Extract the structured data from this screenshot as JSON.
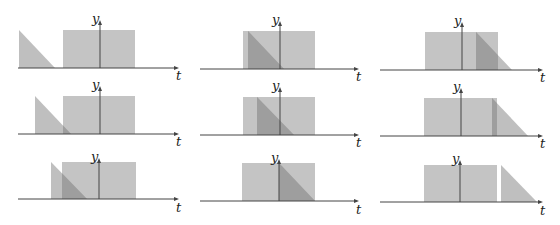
{
  "axis_labels": {
    "y": "y",
    "t": "t"
  },
  "colors": {
    "rect_fill": "#c4c4c4",
    "triangle_fill": "#b4b4b4",
    "overlap_fill": "#9e9e9e",
    "axis": "#444444",
    "background": "#ffffff"
  },
  "panels": [
    {
      "row": 0,
      "col": 0,
      "axis_y": 68,
      "yaxis_x": 100,
      "axis_x0": 18,
      "axis_x1": 179,
      "rect": [
        63,
        135,
        30
      ],
      "tri": [
        19,
        55,
        30
      ],
      "label_y": [
        92,
        17
      ],
      "label_t": [
        176,
        80
      ]
    },
    {
      "row": 0,
      "col": 1,
      "axis_y": 69,
      "yaxis_x": 280,
      "axis_x0": 200,
      "axis_x1": 359,
      "rect": [
        243,
        315,
        31
      ],
      "tri": [
        248,
        284,
        31
      ],
      "label_y": [
        272,
        18
      ],
      "label_t": [
        356,
        81
      ]
    },
    {
      "row": 0,
      "col": 2,
      "axis_y": 70,
      "yaxis_x": 462,
      "axis_x0": 380,
      "axis_x1": 543,
      "rect": [
        425,
        498,
        32
      ],
      "tri": [
        476,
        512,
        32
      ],
      "label_y": [
        454,
        19
      ],
      "label_t": [
        540,
        82
      ]
    },
    {
      "row": 1,
      "col": 0,
      "axis_y": 134,
      "yaxis_x": 100,
      "axis_x0": 18,
      "axis_x1": 179,
      "rect": [
        63,
        135,
        96
      ],
      "tri": [
        35,
        71,
        96
      ],
      "label_y": [
        92,
        83
      ],
      "label_t": [
        176,
        146
      ]
    },
    {
      "row": 1,
      "col": 1,
      "axis_y": 135,
      "yaxis_x": 280,
      "axis_x0": 200,
      "axis_x1": 359,
      "rect": [
        243,
        315,
        97
      ],
      "tri": [
        257,
        294,
        97
      ],
      "label_y": [
        272,
        84
      ],
      "label_t": [
        356,
        147
      ]
    },
    {
      "row": 1,
      "col": 2,
      "axis_y": 136,
      "yaxis_x": 461,
      "axis_x0": 380,
      "axis_x1": 543,
      "rect": [
        424,
        497,
        98
      ],
      "tri": [
        492,
        528,
        98
      ],
      "label_y": [
        453,
        85
      ],
      "label_t": [
        540,
        148
      ]
    },
    {
      "row": 2,
      "col": 0,
      "axis_y": 199,
      "yaxis_x": 99,
      "axis_x0": 18,
      "axis_x1": 179,
      "rect": [
        62,
        136,
        162
      ],
      "tri": [
        51,
        87,
        162
      ],
      "label_y": [
        91,
        155
      ],
      "label_t": [
        176,
        212
      ]
    },
    {
      "row": 2,
      "col": 1,
      "axis_y": 201,
      "yaxis_x": 279,
      "axis_x0": 200,
      "axis_x1": 359,
      "rect": [
        242,
        315,
        163
      ],
      "tri": [
        279,
        315,
        163
      ],
      "label_y": [
        271,
        156
      ],
      "label_t": [
        356,
        214
      ]
    },
    {
      "row": 2,
      "col": 2,
      "axis_y": 202,
      "yaxis_x": 460,
      "axis_x0": 380,
      "axis_x1": 543,
      "rect": [
        424,
        497,
        165
      ],
      "tri": [
        501,
        537,
        165
      ],
      "label_y": [
        452,
        157
      ],
      "label_t": [
        540,
        215
      ]
    }
  ]
}
